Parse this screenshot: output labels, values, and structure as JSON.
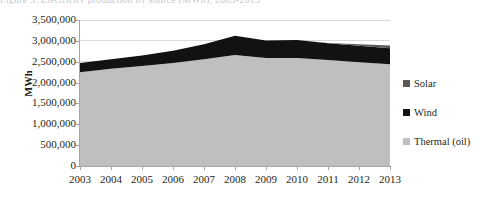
{
  "title": {
    "text": "Figure 3: Electricity production by source (MWh), 2003-2013",
    "cropped": true
  },
  "chart_data": {
    "type": "area",
    "stacked": true,
    "title": "",
    "xlabel": "",
    "ylabel": "MWh",
    "x": [
      "2003",
      "2004",
      "2005",
      "2006",
      "2007",
      "2008",
      "2009",
      "2010",
      "2011",
      "2012",
      "2013"
    ],
    "categories": [
      "2003",
      "2004",
      "2005",
      "2006",
      "2007",
      "2008",
      "2009",
      "2010",
      "2011",
      "2012",
      "2013"
    ],
    "ylim": [
      0,
      3500000
    ],
    "ytick_labels": [
      "3,500,000",
      "3,000,000",
      "2,500,000",
      "2,000,000",
      "1,500,000",
      "1,000,000",
      "500,000",
      "0"
    ],
    "ytick_values": [
      3500000,
      3000000,
      2500000,
      2000000,
      1500000,
      1000000,
      500000,
      0
    ],
    "grid": "horizontal",
    "legend_position": "right",
    "series": [
      {
        "name": "Thermal (oil)",
        "color": "#bfbfbf",
        "values": [
          2250000,
          2330000,
          2400000,
          2470000,
          2560000,
          2660000,
          2590000,
          2590000,
          2540000,
          2490000,
          2440000
        ]
      },
      {
        "name": "Wind",
        "color": "#121212",
        "values": [
          220000,
          230000,
          250000,
          290000,
          360000,
          460000,
          420000,
          430000,
          400000,
          390000,
          380000
        ]
      },
      {
        "name": "Solar",
        "color": "#595959",
        "values": [
          0,
          0,
          0,
          0,
          0,
          0,
          0,
          0,
          10000,
          40000,
          70000
        ]
      }
    ],
    "legend": [
      {
        "label": "Solar",
        "color": "#595959"
      },
      {
        "label": "Wind",
        "color": "#121212"
      },
      {
        "label": "Thermal (oil)",
        "color": "#bfbfbf"
      }
    ]
  },
  "colors": {
    "solar": "#595959",
    "wind": "#121212",
    "thermal": "#bfbfbf",
    "axis": "#a6a6a6",
    "grid": "#d9d9d9",
    "text": "#231f20"
  }
}
